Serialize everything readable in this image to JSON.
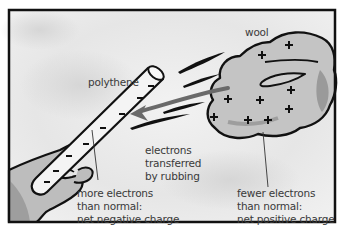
{
  "diagram": {
    "labels": {
      "polythene": "polythene",
      "wool": "wool",
      "transfer": [
        "electrons",
        "transferred",
        "by rubbing"
      ],
      "negative": [
        "more electrons",
        "than normal:",
        "net negative charge"
      ],
      "positive": [
        "fewer electrons",
        "than normal:",
        "net positive charge"
      ]
    },
    "objects": [
      {
        "name": "polythene rod",
        "charge": "negative",
        "symbol": "−",
        "symbol_count": 8
      },
      {
        "name": "wool cloth",
        "charge": "positive",
        "symbol": "+",
        "symbol_count": 9
      }
    ],
    "arrow": {
      "direction": "wool to polythene",
      "meaning": "electrons transferred by rubbing"
    },
    "colors": {
      "background": "#eeeeee",
      "frame": "#111111",
      "wool_fill": "#c4c4c4",
      "hand_fill": "#bdbdbd",
      "rod_fill": "#f4f4f4",
      "arrow": "#6a6a6a",
      "text": "#3a3a3a"
    }
  }
}
